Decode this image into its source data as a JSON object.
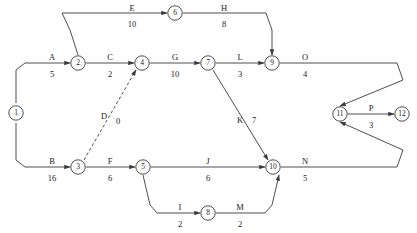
{
  "diagram": {
    "kind": "activity-on-arrow-network",
    "colors": {
      "stroke": "#3a3a3a",
      "text": "#1a1a1a",
      "background": "#ffffff"
    },
    "nodes": [
      {
        "id": "1",
        "label": "1",
        "x": 16,
        "y": 113
      },
      {
        "id": "2",
        "label": "2",
        "x": 78,
        "y": 63
      },
      {
        "id": "3",
        "label": "3",
        "x": 78,
        "y": 167
      },
      {
        "id": "4",
        "label": "4",
        "x": 142,
        "y": 63
      },
      {
        "id": "5",
        "label": "5",
        "x": 143,
        "y": 167
      },
      {
        "id": "6",
        "label": "6",
        "x": 175,
        "y": 13
      },
      {
        "id": "7",
        "label": "7",
        "x": 208,
        "y": 63
      },
      {
        "id": "8",
        "label": "8",
        "x": 208,
        "y": 213
      },
      {
        "id": "9",
        "label": "9",
        "x": 272,
        "y": 63
      },
      {
        "id": "10",
        "label": "10",
        "x": 273,
        "y": 167
      },
      {
        "id": "11",
        "label": "11",
        "x": 340,
        "y": 114
      },
      {
        "id": "12",
        "label": "12",
        "x": 402,
        "y": 114
      }
    ],
    "edges": [
      {
        "id": "A",
        "name": "A",
        "duration": "5",
        "from": "1",
        "to": "2",
        "dashed": false,
        "name_x": 52,
        "name_y": 57,
        "dur_x": 52,
        "dur_y": 74
      },
      {
        "id": "B",
        "name": "B",
        "duration": "16",
        "from": "1",
        "to": "3",
        "dashed": false,
        "name_x": 52,
        "name_y": 161,
        "dur_x": 52,
        "dur_y": 178
      },
      {
        "id": "C",
        "name": "C",
        "duration": "2",
        "from": "2",
        "to": "4",
        "dashed": false,
        "name_x": 110,
        "name_y": 57,
        "dur_x": 110,
        "dur_y": 74
      },
      {
        "id": "D",
        "name": "D",
        "duration": "0",
        "from": "3",
        "to": "4",
        "dashed": true,
        "name_x": 104,
        "name_y": 116,
        "dur_x": 118,
        "dur_y": 121
      },
      {
        "id": "E",
        "name": "E",
        "duration": "10",
        "from": "2",
        "to": "6",
        "dashed": false,
        "name_x": 132,
        "name_y": 8,
        "dur_x": 132,
        "dur_y": 24
      },
      {
        "id": "F",
        "name": "F",
        "duration": "6",
        "from": "3",
        "to": "5",
        "dashed": false,
        "name_x": 110,
        "name_y": 161,
        "dur_x": 110,
        "dur_y": 178
      },
      {
        "id": "G",
        "name": "G",
        "duration": "10",
        "from": "4",
        "to": "7",
        "dashed": false,
        "name_x": 175,
        "name_y": 57,
        "dur_x": 175,
        "dur_y": 74
      },
      {
        "id": "H",
        "name": "H",
        "duration": "8",
        "from": "6",
        "to": "9",
        "dashed": false,
        "name_x": 224,
        "name_y": 8,
        "dur_x": 224,
        "dur_y": 24
      },
      {
        "id": "I",
        "name": "I",
        "duration": "2",
        "from": "5",
        "to": "8",
        "dashed": false,
        "name_x": 180,
        "name_y": 207,
        "dur_x": 180,
        "dur_y": 224
      },
      {
        "id": "J",
        "name": "J",
        "duration": "6",
        "from": "5",
        "to": "10",
        "dashed": false,
        "name_x": 208,
        "name_y": 161,
        "dur_x": 208,
        "dur_y": 178
      },
      {
        "id": "K",
        "name": "K",
        "duration": "7",
        "from": "7",
        "to": "10",
        "dashed": false,
        "name_x": 240,
        "name_y": 120,
        "dur_x": 254,
        "dur_y": 120
      },
      {
        "id": "L",
        "name": "L",
        "duration": "3",
        "from": "7",
        "to": "9",
        "dashed": false,
        "name_x": 240,
        "name_y": 57,
        "dur_x": 240,
        "dur_y": 74
      },
      {
        "id": "M",
        "name": "M",
        "duration": "2",
        "from": "8",
        "to": "10",
        "dashed": false,
        "name_x": 240,
        "name_y": 207,
        "dur_x": 240,
        "dur_y": 224
      },
      {
        "id": "N",
        "name": "N",
        "duration": "5",
        "from": "10",
        "to": "11",
        "dashed": false,
        "name_x": 305,
        "name_y": 161,
        "dur_x": 305,
        "dur_y": 178
      },
      {
        "id": "O",
        "name": "O",
        "duration": "4",
        "from": "9",
        "to": "11",
        "dashed": false,
        "name_x": 305,
        "name_y": 57,
        "dur_x": 305,
        "dur_y": 74
      },
      {
        "id": "P",
        "name": "P",
        "duration": "3",
        "from": "11",
        "to": "12",
        "dashed": false,
        "name_x": 371,
        "name_y": 108,
        "dur_x": 371,
        "dur_y": 125
      }
    ],
    "paths": {
      "A": "M 16,103 L 16,70 L 25,63 L 70,63",
      "B": "M 16,123 L 16,160 L 25,167 L 70,167",
      "C": "M 86,63 L 134,63",
      "D": "M 84,160 L 136,70",
      "E": "M 78,55 L 70,30 L 62,13 L 167,13",
      "F": "M 86,167 L 135,167",
      "G": "M 150,63 L 200,63",
      "H": "M 183,13 L 266,13 L 272,30 L 272,55",
      "I": "M 143,175 L 150,205 L 157,213 L 200,213",
      "J": "M 151,167 L 265,167",
      "K": "M 213,70 L 268,160",
      "L": "M 216,63 L 264,63",
      "M": "M 216,213 L 265,213 L 272,205 L 279,175",
      "N": "M 281,167 L 397,167 L 403,150 L 340,122",
      "O": "M 280,63 L 397,63 L 403,80 L 340,106",
      "P": "M 348,114 L 394,114"
    },
    "path_overrides": {
      "E_comment": "",
      "note": ""
    }
  }
}
